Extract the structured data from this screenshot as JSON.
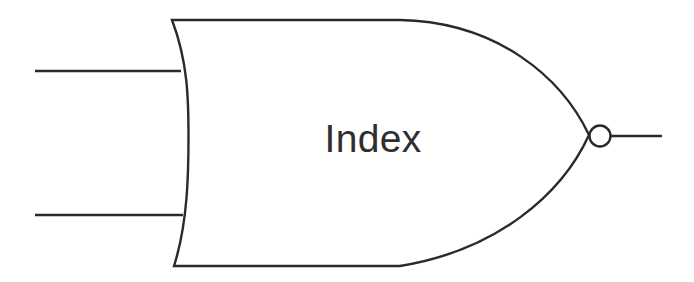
{
  "diagram": {
    "title": "Index",
    "type": "logic-gate",
    "gate_kind": "NOR",
    "label": "Index",
    "colors": {
      "stroke": "#2a2a2a",
      "label": "#2f2f2f",
      "background": "#ffffff",
      "bubble_fill": "#ffffff"
    },
    "geometry": {
      "body_top_y": 20,
      "body_bottom_y": 266,
      "body_left_x": 172,
      "body_tip_x": 590,
      "center_y": 136,
      "back_bulge_x": 188,
      "bubble_center_x": 600,
      "bubble_center_y": 136,
      "bubble_radius": 10.5
    },
    "inputs": [
      {
        "name": "input-line-top",
        "x1": 35,
        "y": 71,
        "x2": 181
      },
      {
        "name": "input-line-bottom",
        "x1": 35,
        "y": 215,
        "x2": 183
      }
    ],
    "output": {
      "name": "output-line",
      "x1": 611,
      "y": 136,
      "x2": 662
    },
    "label_position": {
      "x": 373,
      "y": 152
    }
  }
}
